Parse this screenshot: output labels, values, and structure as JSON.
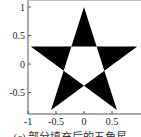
{
  "chart_data": {
    "type": "area",
    "title": "",
    "xlabel": "",
    "ylabel": "",
    "xlim": [
      -1,
      1
    ],
    "ylim": [
      -0.9,
      1.1
    ],
    "grid": false,
    "legend": null,
    "x_ticks": [
      -1,
      -0.5,
      0,
      0.5
    ],
    "x_tick_labels": [
      "-1",
      "-0.5",
      "0",
      "0.5"
    ],
    "y_ticks": [
      1,
      0.5,
      0,
      -0.5
    ],
    "y_tick_labels": [
      "1",
      "0.5",
      "0",
      "-0.5"
    ],
    "shape": "pentagram",
    "outer_vertices": [
      [
        0,
        1
      ],
      [
        0.951,
        0.309
      ],
      [
        0.588,
        -0.809
      ],
      [
        -0.588,
        -0.809
      ],
      [
        -0.951,
        0.309
      ]
    ],
    "inner_vertices": [
      [
        0.225,
        0.309
      ],
      [
        0.363,
        -0.118
      ],
      [
        0,
        -0.382
      ],
      [
        -0.363,
        -0.118
      ],
      [
        -0.225,
        0.309
      ]
    ],
    "fill_color": "#000000",
    "center_color": "#ffffff"
  },
  "caption": "(c) 部分填充后的五角星"
}
